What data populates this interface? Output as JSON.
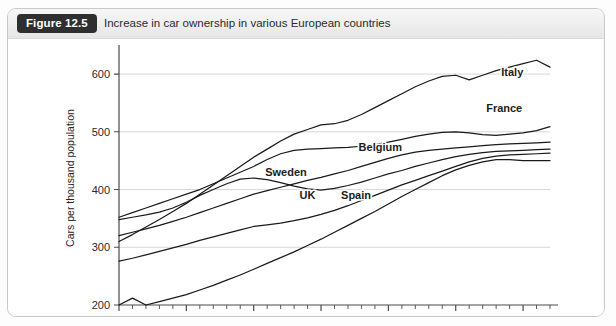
{
  "figure": {
    "badge_label": "Figure 12.5",
    "caption": "Increase in car ownership in various European countries"
  },
  "chart_data": {
    "type": "line",
    "title": "Increase in car ownership in various European countries",
    "xlabel": "",
    "ylabel": "Cars per thousand population",
    "xlim": [
      1980,
      2012
    ],
    "ylim": [
      200,
      640
    ],
    "xticks": [
      1980,
      1985,
      1990,
      1995,
      2000,
      2005,
      2010
    ],
    "xtick_labels": [
      "1980",
      "1985",
      "1990",
      "1995",
      "2000",
      "2005",
      "2010"
    ],
    "yticks": [
      200,
      300,
      400,
      500,
      600
    ],
    "ytick_labels": [
      "200",
      "300",
      "400",
      "500",
      "600"
    ],
    "minor_xtick_interval": 1,
    "grid": "horizontal",
    "legend": "inline-labels",
    "line_color": "#1a1a1a",
    "grid_color": "#d2d2d2",
    "axis_color": "#4a4a4a",
    "x": [
      1980,
      1981,
      1982,
      1983,
      1984,
      1985,
      1986,
      1987,
      1988,
      1989,
      1990,
      1991,
      1992,
      1993,
      1994,
      1995,
      1996,
      1997,
      1998,
      1999,
      2000,
      2001,
      2002,
      2003,
      2004,
      2005,
      2006,
      2007,
      2008,
      2009,
      2010,
      2011,
      2012
    ],
    "series": [
      {
        "name": "Italy",
        "label_x": 2009.2,
        "label_y": 596,
        "values": [
          310,
          322,
          335,
          348,
          362,
          376,
          392,
          408,
          424,
          440,
          456,
          470,
          484,
          496,
          504,
          512,
          514,
          520,
          530,
          542,
          554,
          566,
          578,
          588,
          596,
          598,
          590,
          598,
          606,
          612,
          618,
          624,
          612
        ]
      },
      {
        "name": "France",
        "label_x": 2008.6,
        "label_y": 534,
        "values": [
          352,
          360,
          368,
          376,
          384,
          392,
          400,
          410,
          420,
          430,
          440,
          452,
          462,
          468,
          470,
          471,
          472,
          473,
          475,
          478,
          482,
          487,
          492,
          496,
          499,
          500,
          498,
          495,
          494,
          496,
          498,
          502,
          509
        ]
      },
      {
        "name": "Belgium",
        "label_x": 1999.4,
        "label_y": 466,
        "values": [
          320,
          326,
          332,
          338,
          345,
          352,
          360,
          368,
          376,
          384,
          392,
          398,
          404,
          410,
          416,
          421,
          427,
          433,
          440,
          447,
          454,
          460,
          465,
          468,
          470,
          472,
          474,
          476,
          478,
          479,
          480,
          481,
          482
        ]
      },
      {
        "name": "Sweden",
        "label_x": 1992.4,
        "label_y": 424,
        "values": [
          348,
          352,
          356,
          361,
          368,
          378,
          390,
          400,
          410,
          418,
          420,
          417,
          412,
          406,
          401,
          399,
          402,
          407,
          413,
          420,
          427,
          433,
          440,
          446,
          452,
          457,
          461,
          464,
          466,
          467,
          468,
          469,
          470
        ]
      },
      {
        "name": "UK",
        "label_x": 1994.0,
        "label_y": 383,
        "values": [
          276,
          281,
          287,
          293,
          299,
          305,
          312,
          318,
          324,
          330,
          336,
          339,
          342,
          346,
          351,
          357,
          364,
          372,
          381,
          390,
          399,
          408,
          416,
          424,
          432,
          440,
          448,
          454,
          458,
          460,
          461,
          462,
          463
        ]
      },
      {
        "name": "Spain",
        "label_x": 1997.6,
        "label_y": 383,
        "values": [
          200,
          212,
          200,
          206,
          212,
          218,
          226,
          234,
          243,
          252,
          262,
          272,
          282,
          292,
          303,
          314,
          326,
          338,
          350,
          362,
          375,
          388,
          400,
          412,
          424,
          434,
          442,
          448,
          452,
          452,
          450,
          450,
          450
        ]
      }
    ]
  }
}
